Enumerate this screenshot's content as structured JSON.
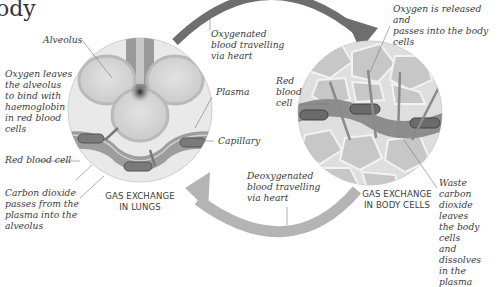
{
  "title_fragment": "ody",
  "left_panel": {
    "caption": "GAS EXCHANGE\nIN LUNGS",
    "labels": {
      "alveolus": "Alveolus",
      "oxygen_leaves": "Oxygen leaves\nthe alveolus\nto bind with\nhaemoglobin\nin red blood\ncells",
      "red_blood_cell": "Red blood cell",
      "carbon_dioxide": "Carbon dioxide\npasses from the\nplasma into the\nalveolus",
      "plasma": "Plasma",
      "capillary": "Capillary"
    }
  },
  "right_panel": {
    "caption": "GAS EXCHANGE\nIN BODY CELLS",
    "labels": {
      "oxygen_released": "Oxygen is released and\npasses into the body cells",
      "red_blood_cell": "Red\nblood\ncell",
      "waste_co2": "Waste carbon\ndioxide leaves\nthe body cells\nand dissolves\nin the plasma"
    }
  },
  "arrows": {
    "top": "Oxygenated\nblood travelling\nvia heart",
    "bottom": "Deoxygenated\nblood travelling\nvia heart"
  },
  "colors": {
    "oxygenated_arrow": "#6e6e6e",
    "deoxygenated_arrow": "#b4b4b4",
    "text": "#3a3a3a"
  }
}
